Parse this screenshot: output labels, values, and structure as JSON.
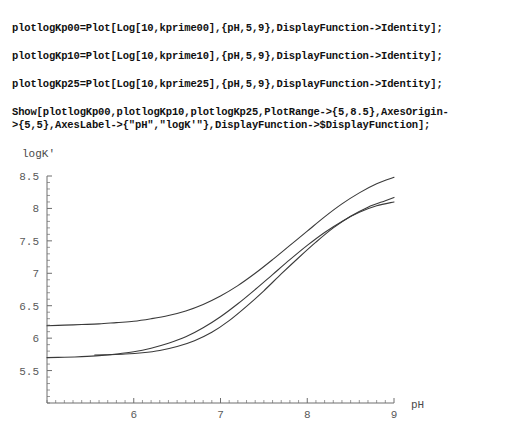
{
  "notebook": {
    "code_cells": [
      {
        "id": "cell-1",
        "text": "plotlogKp00=Plot[Log[10,kprime00],{pH,5,9},DisplayFunction->Identity];"
      },
      {
        "id": "cell-2",
        "text": "plotlogKp10=Plot[Log[10,kprime10],{pH,5,9},DisplayFunction->Identity];"
      },
      {
        "id": "cell-3",
        "text": "plotlogKp25=Plot[Log[10,kprime25],{pH,5,9},DisplayFunction->Identity];"
      },
      {
        "id": "cell-4",
        "text": "Show[plotlogKp00,plotlogKp10,plotlogKp25,PlotRange->{5,8.5},AxesOrigin-\n>{5,5},AxesLabel->{\"pH\",\"logK'\"},DisplayFunction->$DisplayFunction];"
      }
    ]
  },
  "chart_data": {
    "type": "line",
    "title": "",
    "xlabel": "pH",
    "ylabel": "logK'",
    "xlim": [
      5,
      9
    ],
    "ylim": [
      5,
      8.5
    ],
    "xticks": [
      6,
      7,
      8,
      9
    ],
    "xticklabels": [
      "6",
      "7",
      "8",
      "9"
    ],
    "yticks": [
      5.5,
      6,
      6.5,
      7,
      7.5,
      8,
      8.5
    ],
    "yticklabels": [
      "5.5",
      "6",
      "6.5",
      "7",
      "7.5",
      "8",
      "8.5"
    ],
    "grid": false,
    "legend": false,
    "axes_origin": [
      5,
      5
    ],
    "line_color": "#3a3a3a",
    "axis_color": "#6e6e6e",
    "series": [
      {
        "name": "plotlogKp00",
        "x": [
          5.0,
          5.2,
          5.4,
          5.6,
          5.8,
          6.0,
          6.2,
          6.4,
          6.6,
          6.8,
          7.0,
          7.2,
          7.4,
          7.6,
          7.8,
          8.0,
          8.2,
          8.4,
          8.6,
          8.8,
          9.0
        ],
        "y": [
          6.19,
          6.2,
          6.21,
          6.22,
          6.24,
          6.26,
          6.3,
          6.35,
          6.42,
          6.52,
          6.65,
          6.81,
          7.0,
          7.21,
          7.43,
          7.65,
          7.87,
          8.07,
          8.24,
          8.38,
          8.48
        ]
      },
      {
        "name": "plotlogKp10",
        "x": [
          5.55,
          5.7,
          5.9,
          6.1,
          6.3,
          6.5,
          6.7,
          6.9,
          7.1,
          7.3,
          7.5,
          7.7,
          7.9,
          8.1,
          8.3,
          8.5,
          8.7,
          8.9,
          9.0
        ],
        "y": [
          5.74,
          5.745,
          5.755,
          5.775,
          5.81,
          5.87,
          5.96,
          6.09,
          6.27,
          6.49,
          6.73,
          6.99,
          7.24,
          7.48,
          7.7,
          7.88,
          8.02,
          8.12,
          8.17
        ]
      },
      {
        "name": "plotlogKp25",
        "x": [
          5.0,
          5.2,
          5.4,
          5.6,
          5.8,
          6.0,
          6.2,
          6.4,
          6.6,
          6.8,
          7.0,
          7.2,
          7.4,
          7.6,
          7.8,
          8.0,
          8.2,
          8.4,
          8.6,
          8.8,
          9.0
        ],
        "y": [
          5.7,
          5.705,
          5.715,
          5.73,
          5.755,
          5.79,
          5.845,
          5.92,
          6.02,
          6.16,
          6.33,
          6.53,
          6.75,
          6.98,
          7.21,
          7.43,
          7.63,
          7.8,
          7.94,
          8.04,
          8.1
        ]
      }
    ]
  }
}
